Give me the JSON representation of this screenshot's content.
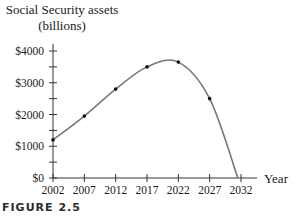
{
  "chart_data": {
    "type": "line",
    "title": "",
    "ylabel": "Social Security assets (billions)",
    "ylabel_line1": "Social Security assets",
    "ylabel_line2": "(billions)",
    "xlabel": "Year",
    "x": [
      2002,
      2007,
      2012,
      2017,
      2022,
      2027,
      2031.5
    ],
    "values": [
      1200,
      1950,
      2800,
      3500,
      3650,
      2500,
      0
    ],
    "marked_points": [
      2002,
      2007,
      2012,
      2017,
      2022,
      2027
    ],
    "x_ticks": [
      "2002",
      "2007",
      "2012",
      "2017",
      "2022",
      "2027",
      "2032"
    ],
    "y_ticks": [
      "$0",
      "$1000",
      "$2000",
      "$3000",
      "$4000"
    ],
    "ylim": [
      0,
      4000
    ],
    "xlim": [
      2002,
      2032
    ],
    "grid": false,
    "legend": null,
    "caption": "FIGURE 2.5",
    "line_color": "#777777",
    "point_color": "#111111"
  }
}
